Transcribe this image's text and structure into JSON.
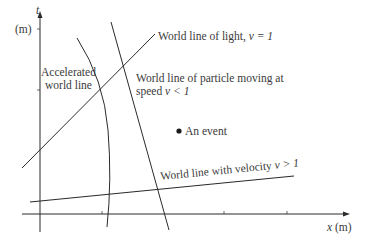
{
  "axes": {
    "y_label_var": "t",
    "y_label_unit": "(m)",
    "x_label": "x (m)",
    "x_label_var": "x",
    "x_label_unit": "(m)"
  },
  "labels": {
    "light": "World line of light,",
    "light_eq": "v = 1",
    "accelerated_line1": "Accelerated",
    "accelerated_line2": "world line",
    "particle_line1": "World line of particle moving at",
    "particle_line2": "speed",
    "particle_eq": "v < 1",
    "event": "An event",
    "superluminal": "World line with velocity",
    "superluminal_eq": "v > 1"
  },
  "colors": {
    "line": "#2b2b2b",
    "text": "#3a3a3a",
    "background": "#ffffff"
  }
}
